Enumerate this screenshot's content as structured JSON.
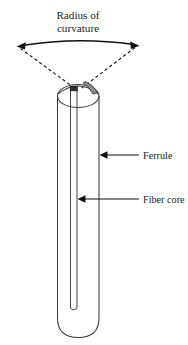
{
  "figure": {
    "kind": "technical-line-diagram",
    "background_color": "#ffffff",
    "line_color": "#1a1a1a"
  },
  "title": {
    "line1": "Radius of",
    "line2": "curvature",
    "align": "center"
  },
  "callouts": [
    {
      "id": "ferrule",
      "label": "Ferrule",
      "arrow_direction": "left",
      "points_at": "cylinder-outer-wall"
    },
    {
      "id": "fiber-core",
      "label": "Fiber core",
      "arrow_direction": "left",
      "points_at": "central-core-tube"
    }
  ],
  "measurement_arrow": {
    "name": "radius-of-curvature-arc",
    "style": "curved double-headed arrow",
    "heads": 2
  },
  "radius_lines": {
    "name": "dashed-radius-lines",
    "style": "dashed",
    "count": 2,
    "converge_at": "dome-apex"
  },
  "parts": {
    "ferrule_body": "cylinder",
    "end_face": "convex dome",
    "core": "narrow central tube",
    "shaded_region": "polished dome highlight",
    "shade_color": "#8a8a8a"
  }
}
